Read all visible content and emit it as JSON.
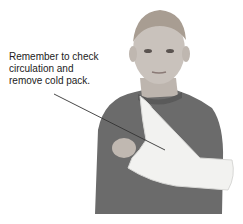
{
  "figure": {
    "annotation_lines": [
      "Remember to check",
      "circulation and",
      "remove cold pack."
    ],
    "colors": {
      "shirt": "#6b6b6b",
      "skin": "#c9c2bc",
      "hair": "#a89d92",
      "sling": "#f2f2f0",
      "leader_line": "#333333"
    }
  }
}
